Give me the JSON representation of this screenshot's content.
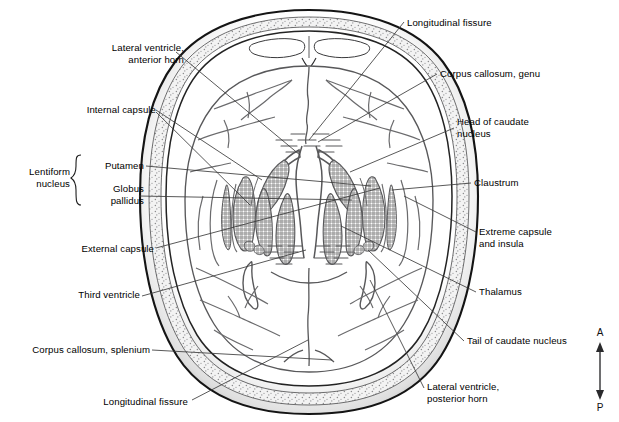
{
  "figure": {
    "background_color": "#ffffff",
    "line_color": "#58585a",
    "outline_color": "#1a1a1a",
    "hatch_color": "#6e6e70",
    "text_color": "#000000",
    "leader_color": "#3b3b3b"
  },
  "orientation": {
    "anterior_label": "A",
    "posterior_label": "P"
  },
  "labels": [
    {
      "id": "longitudinal-fissure-anterior",
      "text_lines": [
        "Longitudinal fissure"
      ],
      "side": "right",
      "x": 407,
      "y": 18
    },
    {
      "id": "lateral-ventricle-anterior-horn",
      "text_lines": [
        "Lateral ventricle,",
        "anterior horn"
      ],
      "side": "left",
      "x": 88,
      "y": 42
    },
    {
      "id": "corpus-callosum-genu",
      "text_lines": [
        "Corpus callosum, genu"
      ],
      "side": "right",
      "x": 440,
      "y": 70
    },
    {
      "id": "internal-capsule",
      "text_lines": [
        "Internal capsule"
      ],
      "side": "left",
      "x": 70,
      "y": 106
    },
    {
      "id": "head-of-caudate-nucleus",
      "text_lines": [
        "Head of caudate",
        "nucleus"
      ],
      "side": "right",
      "x": 457,
      "y": 120
    },
    {
      "id": "lentiform-nucleus",
      "text_lines": [
        "Lentiform",
        "nucleus"
      ],
      "side": "left",
      "x": 30,
      "y": 168
    },
    {
      "id": "putamen",
      "text_lines": [
        "Putamen"
      ],
      "side": "left",
      "x": 86,
      "y": 162
    },
    {
      "id": "globus-pallidus",
      "text_lines": [
        "Globus",
        "pallidus"
      ],
      "side": "left",
      "x": 86,
      "y": 188
    },
    {
      "id": "claustrum",
      "text_lines": [
        "Claustrum"
      ],
      "side": "right",
      "x": 474,
      "y": 179
    },
    {
      "id": "external-capsule",
      "text_lines": [
        "External capsule"
      ],
      "side": "left",
      "x": 44,
      "y": 246
    },
    {
      "id": "extreme-capsule-and-insula",
      "text_lines": [
        "Extreme capsule",
        "and insula"
      ],
      "side": "right",
      "x": 479,
      "y": 228
    },
    {
      "id": "thalamus",
      "text_lines": [
        "Thalamus"
      ],
      "side": "right",
      "x": 479,
      "y": 288
    },
    {
      "id": "third-ventricle",
      "text_lines": [
        "Third ventricle"
      ],
      "side": "left",
      "x": 57,
      "y": 292
    },
    {
      "id": "tail-of-caudate-nucleus",
      "text_lines": [
        "Tail of caudate nucleus"
      ],
      "side": "right",
      "x": 467,
      "y": 337
    },
    {
      "id": "corpus-callosum-splenium",
      "text_lines": [
        "Corpus callosum, splenium"
      ],
      "side": "left",
      "x": 14,
      "y": 347
    },
    {
      "id": "lateral-ventricle-posterior-horn",
      "text_lines": [
        "Lateral ventricle,",
        "posterior horn"
      ],
      "side": "right",
      "x": 427,
      "y": 384
    },
    {
      "id": "longitudinal-fissure-posterior",
      "text_lines": [
        "Longitudinal fissure"
      ],
      "side": "left",
      "x": 85,
      "y": 398
    }
  ]
}
